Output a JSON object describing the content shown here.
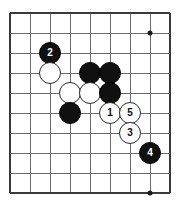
{
  "board": {
    "title": "Go board diagram",
    "background_color": "#ffffff",
    "line_color": "#6b6b6b",
    "edge_color": "#3a3a3a",
    "black_stone_color": "#101010",
    "white_stone_color": "#ffffff",
    "cell_size": 20,
    "stone_diameter": 22,
    "columns": 9,
    "rows": 10,
    "vertical_lines_x": [
      10,
      30,
      50,
      70,
      90,
      110,
      130,
      150,
      170
    ],
    "horizontal_lines_y": [
      13,
      33,
      53,
      73,
      93,
      113,
      133,
      153,
      173,
      193
    ],
    "edges": {
      "top_y": 13,
      "bottom_y": 193,
      "left_x": 10,
      "right_x": 170
    },
    "star_points": [
      {
        "name": "star-point-upper-right",
        "x": 150,
        "y": 33
      },
      {
        "name": "star-point-lower-right",
        "x": 150,
        "y": 193
      }
    ],
    "stones": [
      {
        "name": "stone-black-2",
        "color": "black",
        "label": "2",
        "x": 50,
        "y": 53
      },
      {
        "name": "stone-white-a",
        "color": "white",
        "label": "",
        "x": 50,
        "y": 73
      },
      {
        "name": "stone-black-a",
        "color": "black",
        "label": "",
        "x": 90,
        "y": 73
      },
      {
        "name": "stone-black-b",
        "color": "black",
        "label": "",
        "x": 110,
        "y": 73
      },
      {
        "name": "stone-white-b",
        "color": "white",
        "label": "",
        "x": 70,
        "y": 93
      },
      {
        "name": "stone-white-c",
        "color": "white",
        "label": "",
        "x": 90,
        "y": 93
      },
      {
        "name": "stone-black-c",
        "color": "black",
        "label": "",
        "x": 110,
        "y": 93
      },
      {
        "name": "stone-black-d",
        "color": "black",
        "label": "",
        "x": 70,
        "y": 113
      },
      {
        "name": "stone-white-1",
        "color": "white",
        "label": "1",
        "x": 110,
        "y": 113
      },
      {
        "name": "stone-white-5",
        "color": "white",
        "label": "5",
        "x": 130,
        "y": 113
      },
      {
        "name": "stone-white-3",
        "color": "white",
        "label": "3",
        "x": 130,
        "y": 133
      },
      {
        "name": "stone-black-4",
        "color": "black",
        "label": "4",
        "x": 150,
        "y": 153
      }
    ]
  }
}
